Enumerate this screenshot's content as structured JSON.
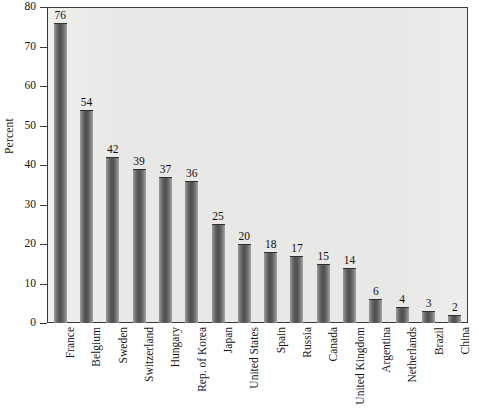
{
  "chart_data": {
    "type": "bar",
    "title": "",
    "subtitle": "",
    "xlabel": "",
    "ylabel": "Percent",
    "ylim": [
      0,
      80
    ],
    "ytick_values": [
      0,
      10,
      20,
      30,
      40,
      50,
      60,
      70,
      80
    ],
    "ytick_labels": [
      "0",
      "10",
      "20",
      "30",
      "40",
      "50",
      "60",
      "70",
      "80"
    ],
    "grid": false,
    "legend": false,
    "legend_position": "none",
    "show_value_labels": true,
    "categories": [
      "France",
      "Belgium",
      "Sweden",
      "Switzerland",
      "Hungary",
      "Rep. of Korea",
      "Japan",
      "United States",
      "Spain",
      "Russia",
      "Canada",
      "United Kingdom",
      "Argentina",
      "Netherlands",
      "Brazil",
      "China"
    ],
    "values": [
      76,
      54,
      42,
      39,
      37,
      36,
      25,
      20,
      18,
      17,
      15,
      14,
      6,
      4,
      3,
      2
    ],
    "value_labels": [
      "76",
      "54",
      "42",
      "39",
      "37",
      "36",
      "25",
      "20",
      "18",
      "17",
      "15",
      "14",
      "6",
      "4",
      "3",
      "2"
    ],
    "colors": {
      "bar_dark": "#4e4e4c",
      "bar_light": "#a6a6a4",
      "plot_background": "#e8e8e6",
      "axis": "#3a3a3a",
      "text": "#151515",
      "page_background": "#ffffff"
    }
  }
}
